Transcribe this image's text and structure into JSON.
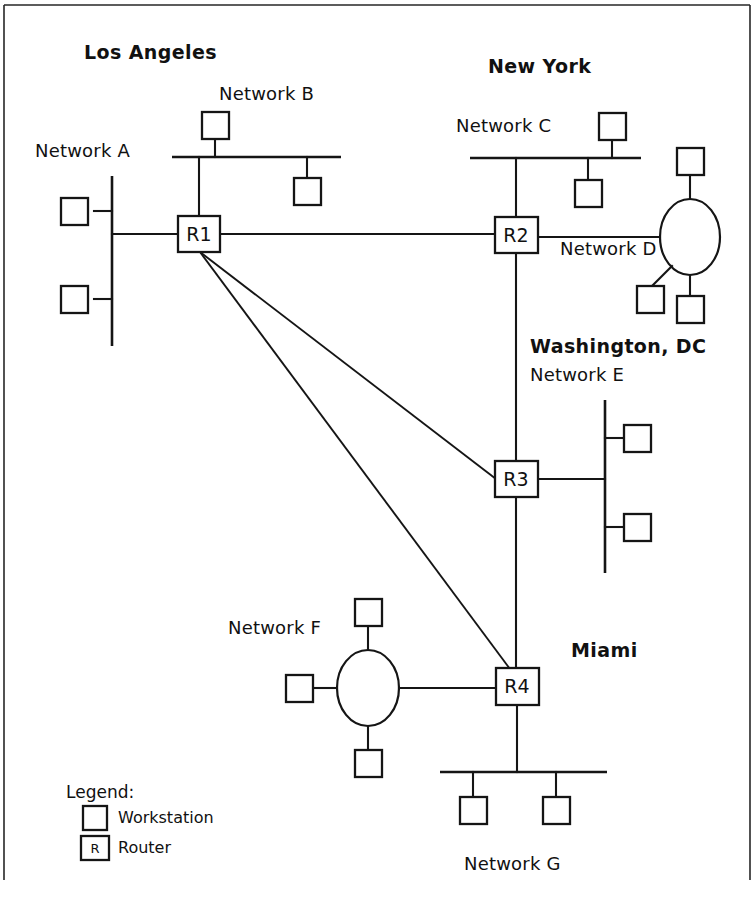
{
  "diagram": {
    "kind": "network-topology",
    "background_color": "#ffffff",
    "line_color": "#151515",
    "canvas": {
      "width": 754,
      "height": 909
    }
  },
  "cities": [
    {
      "id": "los-angeles",
      "label": "Los Angeles",
      "x": 84,
      "y": 52
    },
    {
      "id": "new-york",
      "label": "New York",
      "x": 488,
      "y": 66
    },
    {
      "id": "washington-dc",
      "label": "Washington, DC",
      "x": 530,
      "y": 338
    },
    {
      "id": "miami",
      "label": "Miami",
      "x": 571,
      "y": 643
    }
  ],
  "networks": [
    {
      "id": "network-a",
      "label": "Network A",
      "type": "bus-vertical",
      "x": 35,
      "y": 144
    },
    {
      "id": "network-b",
      "label": "Network B",
      "type": "bus-horizontal",
      "x": 219,
      "y": 86
    },
    {
      "id": "network-c",
      "label": "Network C",
      "type": "bus-horizontal",
      "x": 456,
      "y": 117
    },
    {
      "id": "network-d",
      "label": "Network D",
      "type": "ring",
      "x": 560,
      "y": 240
    },
    {
      "id": "network-e",
      "label": "Network E",
      "type": "bus-vertical",
      "x": 530,
      "y": 366
    },
    {
      "id": "network-f",
      "label": "Network F",
      "type": "ring",
      "x": 228,
      "y": 620
    },
    {
      "id": "network-g",
      "label": "Network G",
      "type": "bus-horizontal",
      "x": 464,
      "y": 855
    }
  ],
  "routers": [
    {
      "id": "r1",
      "label": "R1",
      "city": "Los Angeles",
      "cx": 199,
      "cy": 234
    },
    {
      "id": "r2",
      "label": "R2",
      "city": "New York",
      "cx": 516,
      "cy": 235
    },
    {
      "id": "r3",
      "label": "R3",
      "city": "Washington, DC",
      "cx": 516,
      "cy": 479
    },
    {
      "id": "r4",
      "label": "R4",
      "city": "Miami",
      "cx": 517,
      "cy": 686
    }
  ],
  "workstation_counts": {
    "network_a": 2,
    "network_b": 2,
    "network_c": 2,
    "network_d": 3,
    "network_e": 2,
    "network_f": 3,
    "network_g": 2,
    "total": 16
  },
  "wan_links": [
    {
      "from": "R1",
      "to": "R2"
    },
    {
      "from": "R1",
      "to": "R3"
    },
    {
      "from": "R1",
      "to": "R4"
    },
    {
      "from": "R2",
      "to": "R3"
    },
    {
      "from": "R3",
      "to": "R4"
    }
  ],
  "legend": {
    "title": "Legend:",
    "title_x": 66,
    "title_y": 792,
    "items": [
      {
        "id": "workstation",
        "symbol": "empty-square",
        "label": "Workstation",
        "x": 118,
        "y": 818
      },
      {
        "id": "router",
        "symbol": "square-with-R",
        "symbol_text": "R",
        "label": "Router",
        "x": 118,
        "y": 848
      }
    ]
  }
}
